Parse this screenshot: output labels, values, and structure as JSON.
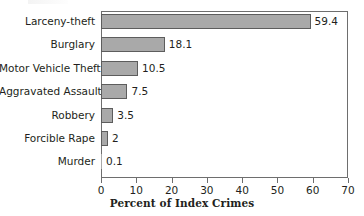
{
  "chart_data": {
    "type": "bar",
    "orientation": "horizontal",
    "title": "",
    "xlabel": "Percent of Index Crimes",
    "ylabel": "",
    "categories": [
      "Larceny-theft",
      "Burglary",
      "Motor Vehicle Theft",
      "Aggravated Assault",
      "Robbery",
      "Forcible Rape",
      "Murder"
    ],
    "values": [
      59.4,
      18.1,
      10.5,
      7.5,
      3.5,
      2,
      0.1
    ],
    "value_labels": [
      "59.4",
      "18.1",
      "10.5",
      "7.5",
      "3.5",
      "2",
      "0.1"
    ],
    "xlim": [
      0,
      70
    ],
    "xticks": [
      0,
      10,
      20,
      30,
      40,
      50,
      60,
      70
    ],
    "xtick_labels": [
      "0",
      "10",
      "20",
      "30",
      "40",
      "50",
      "60",
      "70"
    ],
    "grid": false,
    "legend": null,
    "bar_color": "#a9a9a9",
    "bar_border_color": "#5d5d5d",
    "frame_color": "#6e6e6e",
    "text_color": "#231f20"
  }
}
